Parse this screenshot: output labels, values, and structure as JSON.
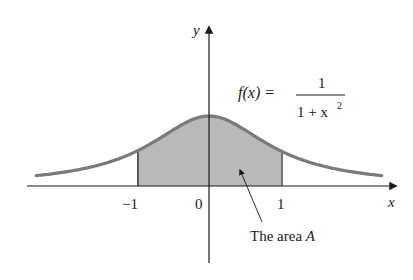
{
  "figure": {
    "function_label": {
      "lhs": "f(x) =",
      "numerator": "1",
      "denominator_base": "1 + x",
      "denominator_exp": "2"
    },
    "axis_labels": {
      "x": "x",
      "y": "y"
    },
    "tick_labels": [
      "−1",
      "0",
      "1"
    ],
    "annotation": {
      "text_prefix": "The area ",
      "text_var": "A"
    },
    "colors": {
      "curve": "#7a7a7a",
      "fill": "#b9b9b9",
      "axes": "#1a1a1a"
    }
  },
  "chart_data": {
    "type": "area",
    "title": "",
    "function": "f(x) = 1 / (1 + x^2)",
    "xlabel": "x",
    "ylabel": "y",
    "x_ticks": [
      -1,
      0,
      1
    ],
    "shaded_interval": [
      -1,
      1
    ],
    "shaded_label": "The area A",
    "xlim": [
      -2.4,
      2.4
    ],
    "ylim": [
      0,
      1
    ],
    "grid": false,
    "legend": "none",
    "x": [
      -2.4,
      -2,
      -1.5,
      -1,
      -0.5,
      0,
      0.5,
      1,
      1.5,
      2,
      2.4
    ],
    "y": [
      0.148,
      0.2,
      0.308,
      0.5,
      0.8,
      1.0,
      0.8,
      0.5,
      0.308,
      0.2,
      0.148
    ]
  }
}
